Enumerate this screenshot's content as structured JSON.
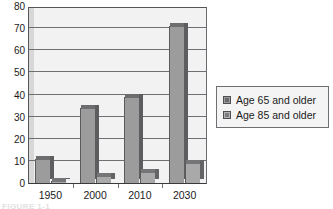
{
  "chart_data": {
    "type": "bar",
    "title": "",
    "subtitle": "",
    "xlabel": "",
    "ylabel": "",
    "categories": [
      "1950",
      "2000",
      "2010",
      "2030"
    ],
    "series": [
      {
        "name": "Age 65 and older",
        "values": [
          11,
          34,
          39,
          71
        ],
        "color": "#9c9c9c"
      },
      {
        "name": "Age 85 and older",
        "values": [
          1,
          3,
          5,
          9
        ],
        "color": "#a9a9a9"
      }
    ],
    "ylim": [
      0,
      80
    ],
    "ytick_labels": [
      "0",
      "10",
      "20",
      "30",
      "40",
      "50",
      "60",
      "70",
      "80"
    ],
    "ytick_values": [
      0,
      10,
      20,
      30,
      40,
      50,
      60,
      70,
      80
    ],
    "grid": true,
    "grid_axis": "y",
    "legend_position": "right",
    "plot_background": "#f2f2f2",
    "frame_color": "#55555a",
    "bar_style": "3d-bevel"
  },
  "legend": {
    "entries": [
      {
        "label": "Age 65 and older",
        "swatch": "legend-swatch-dark"
      },
      {
        "label": "Age 85 and older",
        "swatch": "legend-swatch-light"
      }
    ]
  },
  "caption": {
    "text": "FIGURE 1-1"
  }
}
